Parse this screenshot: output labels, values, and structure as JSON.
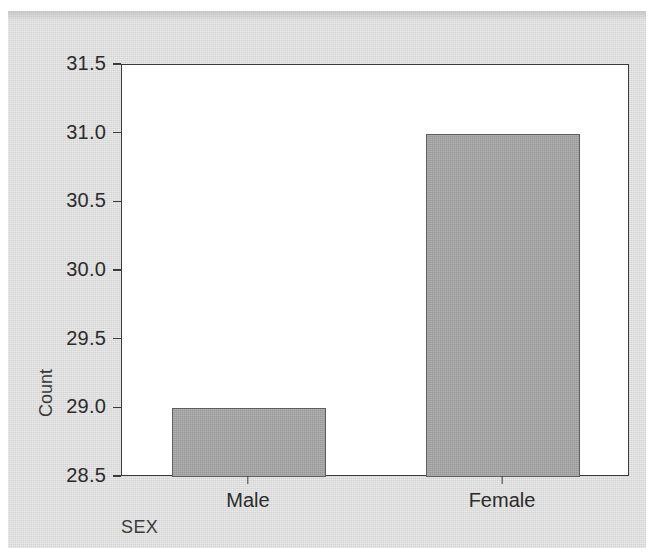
{
  "chart_data": {
    "type": "bar",
    "title": "",
    "subtitle": "",
    "categories": [
      "Male",
      "Female"
    ],
    "values": [
      29,
      31
    ],
    "series": [
      {
        "name": "Count",
        "values": [
          29,
          31
        ]
      }
    ],
    "xlabel": "SEX",
    "ylabel": "Count",
    "ylim": [
      28.5,
      31.5
    ],
    "y_ticks": [
      "28.5",
      "29.0",
      "29.5",
      "30.0",
      "30.5",
      "31.0",
      "31.5"
    ],
    "y_tick_values": [
      28.5,
      29.0,
      29.5,
      30.0,
      30.5,
      31.0,
      31.5
    ],
    "grid": false,
    "legend": false,
    "legend_position": "none",
    "bar_color": "#a2a2a2",
    "bar_border_color": "#5e5e5e",
    "axis_color": "#3b3b3b",
    "plot_background": "#ffffff",
    "figure_background": "#d9d9d9",
    "text_color": "#2b2b2b"
  },
  "axes": {
    "y": {
      "title": "Count",
      "ticks": [
        {
          "label": "31.5",
          "value": 31.5
        },
        {
          "label": "31.0",
          "value": 31.0
        },
        {
          "label": "30.5",
          "value": 30.5
        },
        {
          "label": "30.0",
          "value": 30.0
        },
        {
          "label": "29.5",
          "value": 29.5
        },
        {
          "label": "29.0",
          "value": 29.0
        },
        {
          "label": "28.5",
          "value": 28.5
        }
      ]
    },
    "x": {
      "title": "SEX",
      "ticks": [
        {
          "label": "Male",
          "value": 29
        },
        {
          "label": "Female",
          "value": 31
        }
      ]
    }
  }
}
